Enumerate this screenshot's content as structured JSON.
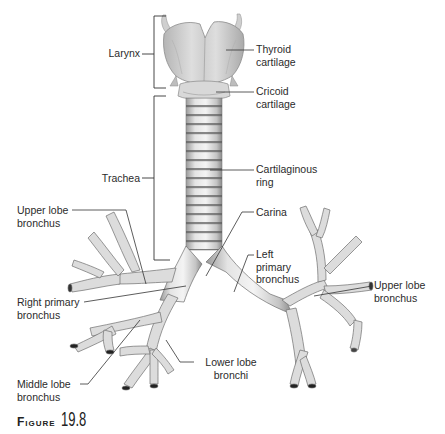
{
  "figure": {
    "caption_word": "Figure",
    "caption_number": "19.8"
  },
  "labels": {
    "larynx": "Larynx",
    "thyroid_cartilage": "Thyroid\ncartilage",
    "cricoid_cartilage": "Cricoid\ncartilage",
    "trachea": "Trachea",
    "cartilaginous_ring": "Cartilaginous\nring",
    "carina": "Carina",
    "upper_lobe_bronchus_right": "Upper lobe\nbronchus",
    "left_primary_bronchus": "Left\nprimary\nbronchus",
    "right_primary_bronchus": "Right primary\nbronchus",
    "upper_lobe_bronchus_left": "Upper lobe\nbronchus",
    "middle_lobe_bronchus": "Middle lobe\nbronchus",
    "lower_lobe_bronchi": "Lower lobe\nbronchi"
  },
  "colors": {
    "tissue_light": "#ececec",
    "tissue_mid": "#c9c9c9",
    "tissue_dark": "#8c8c8c",
    "ring_dark": "#555555",
    "leader_line": "#333333",
    "text": "#2b2b2b"
  }
}
